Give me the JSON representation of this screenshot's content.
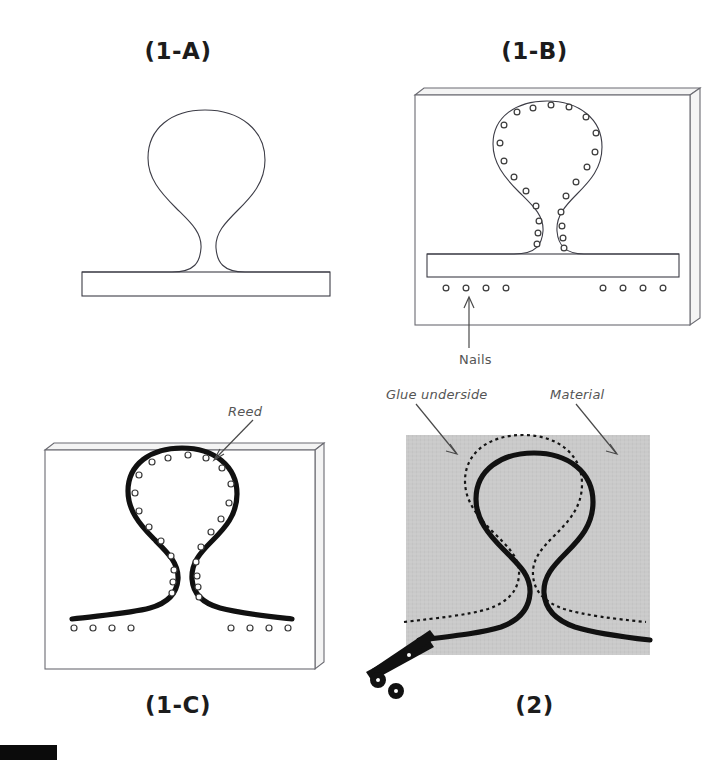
{
  "document": {
    "kind": "craft-instruction-diagram",
    "background_color": "#ffffff",
    "width": 713,
    "height": 760
  },
  "panels": [
    {
      "id": "1-A",
      "title": "(1-A)",
      "title_position": "top",
      "description": "Outline of the reed shape drawn as a thin line on a flat base bar",
      "has_board": false,
      "has_nails": false,
      "reed_weight": "thin"
    },
    {
      "id": "1-B",
      "title": "(1-B)",
      "title_position": "top",
      "description": "Nails hammered into a board following the outline and along the base bar",
      "has_board": true,
      "has_nails": true,
      "reed_weight": "thin"
    },
    {
      "id": "1-C",
      "title": "(1-C)",
      "title_position": "bottom",
      "description": "Reed bent around the nails to take the shape",
      "has_board": true,
      "has_nails": true,
      "reed_weight": "thick"
    },
    {
      "id": "2",
      "title": "(2)",
      "title_position": "bottom",
      "description": "Reed glued onto material, dotted cutting line offset outside the reed, cut with scissors",
      "has_board": false,
      "has_nails": false,
      "reed_weight": "thick",
      "fabric_color": "#c9c9c9"
    }
  ],
  "callouts": [
    {
      "id": "nails",
      "text": "Nails",
      "panel": "1-B",
      "arrow": "up"
    },
    {
      "id": "reed",
      "text": "Reed",
      "panel": "1-C",
      "arrow": "down-left"
    },
    {
      "id": "glue-underside",
      "text": "Glue underside",
      "panel": "2",
      "arrow": "down-right"
    },
    {
      "id": "material",
      "text": "Material",
      "panel": "2",
      "arrow": "down-right"
    }
  ],
  "icons": [
    {
      "id": "scissors-icon",
      "name": "scissors-icon",
      "panel": "2"
    }
  ],
  "colors": {
    "outline": "#3c3c46",
    "board_line": "#6b6b72",
    "reed": "#111111",
    "fabric": "#c9c9c9",
    "label_text": "#555555",
    "title_text": "#1c1c1c",
    "black_bar": "#0b0b0b"
  },
  "marks": {
    "bottom_black_bar": {
      "x": 0,
      "y": 745,
      "width": 57,
      "height": 15
    }
  }
}
